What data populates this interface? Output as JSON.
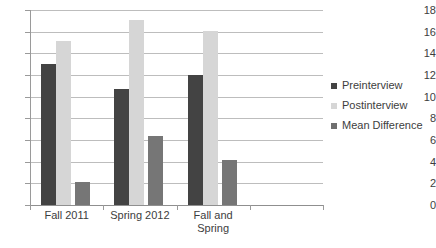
{
  "chart_data": {
    "type": "bar",
    "title": "",
    "xlabel": "",
    "ylabel": "",
    "ylim": [
      0,
      18
    ],
    "ytick_step": 2,
    "yticks": [
      18,
      16,
      14,
      12,
      10,
      8,
      6,
      4,
      2,
      0
    ],
    "grid": true,
    "legend_position": "right",
    "categories": [
      "Fall 2011",
      "Spring 2012",
      "Fall and\nSpring"
    ],
    "category_lines": [
      [
        "Fall 2011"
      ],
      [
        "Spring 2012"
      ],
      [
        "Fall and",
        "Spring"
      ]
    ],
    "series": [
      {
        "name": "Preinterview",
        "color": "#434343",
        "values": [
          13.0,
          10.75,
          12.0
        ]
      },
      {
        "name": "Postinterview",
        "color": "#d6d6d6",
        "values": [
          15.1,
          17.1,
          16.1
        ]
      },
      {
        "name": "Mean Difference",
        "color": "#767676",
        "values": [
          2.1,
          6.35,
          4.2
        ]
      }
    ]
  },
  "axis": {
    "y": {
      "labels": [
        "18",
        "16",
        "14",
        "12",
        "10",
        "8",
        "6",
        "4",
        "2",
        "0"
      ],
      "values": [
        18,
        16,
        14,
        12,
        10,
        8,
        6,
        4,
        2,
        0
      ]
    }
  },
  "legend": {
    "items": [
      {
        "label": "Preinterview",
        "color": "#434343"
      },
      {
        "label": "Postinterview",
        "color": "#d6d6d6"
      },
      {
        "label": "Mean Difference",
        "color": "#6f6f6f"
      }
    ]
  },
  "title_sliver": ""
}
